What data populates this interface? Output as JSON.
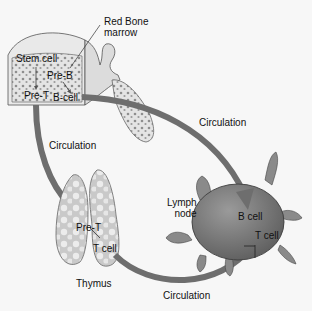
{
  "diagram": {
    "type": "lymphocyte-development-pathway",
    "labels": {
      "red_bone_marrow_line1": "Red Bone",
      "red_bone_marrow_line2": "marrow",
      "stem_cell": "Stem cell",
      "pre_b": "Pre-B",
      "pre_t_marrow": "Pre-T",
      "b_cell_marrow": "B-cell",
      "circulation_top": "Circulation",
      "circulation_left": "Circulation",
      "circulation_bottom": "Circulation",
      "pre_t_thymus": "Pre-T",
      "t_cell_thymus": "T cell",
      "thymus": "Thymus",
      "lymph_node_line1": "Lymph",
      "lymph_node_line2": "node",
      "b_cell_node": "B cell",
      "t_cell_node": "T cell"
    },
    "nodes": [
      {
        "id": "bone-marrow",
        "name": "Red Bone marrow"
      },
      {
        "id": "thymus",
        "name": "Thymus"
      },
      {
        "id": "lymph-node",
        "name": "Lymph node"
      }
    ],
    "edges": [
      {
        "from": "bone-marrow",
        "to": "lymph-node",
        "label": "Circulation",
        "carries": "B cell"
      },
      {
        "from": "bone-marrow",
        "to": "thymus",
        "label": "Circulation",
        "carries": "Pre-T"
      },
      {
        "from": "thymus",
        "to": "lymph-node",
        "label": "Circulation",
        "carries": "T cell"
      }
    ],
    "colors": {
      "arrow": "#6e6e6e",
      "bone": "#e2e2e2",
      "marrow_dots": "#8a8a8a",
      "thymus": "#d0d0d0",
      "lymph_node": "#7b7b7b",
      "background": "#f7f7f7"
    }
  }
}
